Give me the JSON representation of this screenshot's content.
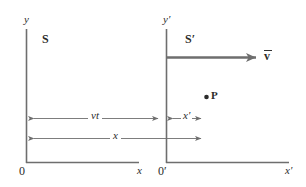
{
  "diagram": {
    "background_color": "#ffffff",
    "line_color": "#6e6e6e",
    "text_color": "#2b2b2b",
    "frames": [
      {
        "name": "frame-S",
        "label": "S",
        "y_axis_label": "y",
        "x_axis_label": "x",
        "origin_label": "0"
      },
      {
        "name": "frame-S-prime",
        "label": "S′",
        "y_axis_label": "y′",
        "x_axis_label": "x′",
        "origin_label": "0′"
      }
    ],
    "velocity": {
      "label": "v",
      "vector_notation": "arrow-over"
    },
    "point": {
      "label": "P",
      "marker": "filled-dot"
    },
    "dimensions": [
      {
        "name": "vt",
        "label": "vt"
      },
      {
        "name": "x",
        "label": "x"
      },
      {
        "name": "x-prime",
        "label": "x′"
      }
    ]
  }
}
